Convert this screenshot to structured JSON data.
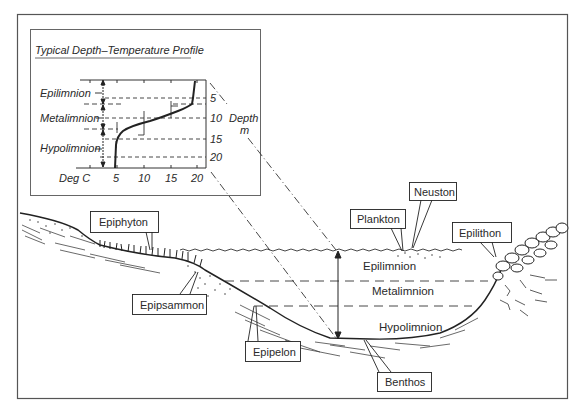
{
  "inset": {
    "title": "Typical Depth–Temperature Profile",
    "zones": [
      "Epilimnion",
      "Metalimnion",
      "Hypolimnion"
    ],
    "x_axis_label": "Deg C",
    "x_ticks": [
      "5",
      "10",
      "15",
      "20"
    ],
    "y_ticks": [
      "5",
      "10",
      "15",
      "20"
    ],
    "y_axis_label_line1": "Depth",
    "y_axis_label_line2": "m"
  },
  "lake": {
    "layers": [
      "Epilimnion",
      "Metalimnion",
      "Hypolimnion"
    ]
  },
  "callouts": {
    "epiphyton": "Epiphyton",
    "epipsammon": "Epipsammon",
    "epipelon": "Epipelon",
    "plankton": "Plankton",
    "neuston": "Neuston",
    "epilithon": "Epilithon",
    "benthos": "Benthos"
  },
  "colors": {
    "ink": "#2a2a2a",
    "frame": "#555555",
    "background": "#ffffff"
  }
}
